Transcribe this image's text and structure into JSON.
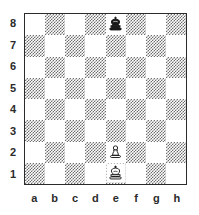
{
  "diagram": {
    "type": "chess-board-diagram",
    "orientation": "white-bottom",
    "board_size": 8,
    "light_square_color": "#ffffff",
    "dark_square_color": "#6e6e6e",
    "border_color": "#2b2b2b",
    "label_color": "#2b2b2b",
    "a8_square_shade": "light",
    "a1_square_shade": "dark"
  },
  "labels": {
    "files": [
      "a",
      "b",
      "c",
      "d",
      "e",
      "f",
      "g",
      "h"
    ],
    "ranks": [
      "8",
      "7",
      "6",
      "5",
      "4",
      "3",
      "2",
      "1"
    ]
  },
  "position": {
    "fen": "4k3/8/8/8/8/8/4P3/4K3",
    "pieces": [
      {
        "square": "e8",
        "color": "black",
        "type": "king",
        "glyph": "black-king-icon"
      },
      {
        "square": "e2",
        "color": "white",
        "type": "pawn",
        "glyph": "white-pawn-icon"
      },
      {
        "square": "e1",
        "color": "white",
        "type": "king",
        "glyph": "white-king-icon"
      }
    ],
    "white_pieces_text": "Ke1, Pe2",
    "black_pieces_text": "Ke8"
  }
}
